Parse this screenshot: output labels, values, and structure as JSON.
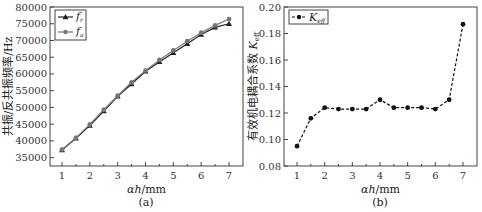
{
  "chart_data": [
    {
      "panel": "(a)",
      "type": "line",
      "title": "",
      "xlabel": "αh/mm",
      "ylabel": "共振/反共振频率/Hz",
      "xlim": [
        0.5,
        7.3
      ],
      "ylim": [
        32500,
        80000
      ],
      "xticks": [
        1,
        2,
        3,
        4,
        5,
        6,
        7
      ],
      "yticks": [
        35000,
        40000,
        45000,
        50000,
        55000,
        60000,
        65000,
        70000,
        75000,
        80000
      ],
      "legend_position": "upper left",
      "x": [
        1,
        1.5,
        2,
        2.5,
        3,
        3.5,
        4,
        4.5,
        5,
        5.5,
        6,
        6.5,
        7
      ],
      "series": [
        {
          "name": "f_r",
          "marker": "triangle",
          "color": "#222222",
          "values": [
            37300,
            40800,
            44600,
            48900,
            53300,
            57000,
            60800,
            63600,
            66300,
            69000,
            71800,
            73900,
            75000
          ]
        },
        {
          "name": "f_a",
          "marker": "circle",
          "color": "#777777",
          "values": [
            37400,
            40900,
            44900,
            49300,
            53500,
            57500,
            61000,
            64200,
            67000,
            69800,
            72300,
            74500,
            76400
          ]
        }
      ],
      "caption": "(a)"
    },
    {
      "panel": "(b)",
      "type": "line",
      "title": "",
      "xlabel": "αh/mm",
      "ylabel": "有效机电耦合系数 K_eff",
      "xlim": [
        0.5,
        7.3
      ],
      "ylim": [
        0.08,
        0.2
      ],
      "xticks": [
        1,
        2,
        3,
        4,
        5,
        6,
        7
      ],
      "yticks": [
        0.08,
        0.1,
        0.12,
        0.14,
        0.16,
        0.18,
        0.2
      ],
      "legend_position": "upper left",
      "x": [
        1,
        1.5,
        2,
        2.5,
        3,
        3.5,
        4,
        4.5,
        5,
        5.5,
        6,
        6.5,
        7
      ],
      "series": [
        {
          "name": "K_eff",
          "marker": "circle",
          "linestyle": "dashed",
          "color": "#111111",
          "values": [
            0.095,
            0.116,
            0.124,
            0.123,
            0.123,
            0.123,
            0.13,
            0.124,
            0.124,
            0.124,
            0.123,
            0.13,
            0.187
          ]
        }
      ],
      "caption": "(b)"
    }
  ],
  "labels": {
    "a_ylabel": "共振/反共振频率/Hz",
    "b_ylabel": "有效机电耦合系数",
    "xlabel": "αh/mm",
    "cap_a": "(a)",
    "cap_b": "(b)",
    "legend_fr": "f",
    "legend_fr_sub": "r",
    "legend_fa": "f",
    "legend_fa_sub": "a",
    "legend_k": "K",
    "legend_k_sub": "eff"
  }
}
